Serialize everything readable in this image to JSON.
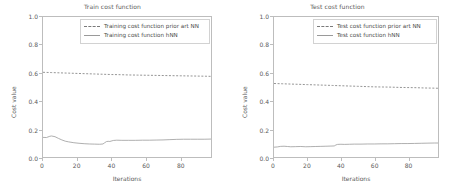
{
  "figure": {
    "background": "#ffffff",
    "axis_color": "#bdbdbd",
    "text_color": "#5a5a5a",
    "dashed_color": "#7a7a7a",
    "solid_color": "#9a9a9a"
  },
  "chart_data": [
    {
      "type": "line",
      "title": "Train cost function",
      "xlabel": "Iterations",
      "ylabel": "Cost value",
      "xlim": [
        0,
        98
      ],
      "ylim": [
        0.0,
        1.0
      ],
      "xticks": [
        0,
        20,
        40,
        60,
        80
      ],
      "yticks": [
        "0.0",
        "0.2",
        "0.4",
        "0.6",
        "0.8",
        "1.0"
      ],
      "grid": false,
      "legend_position": "upper center",
      "series": [
        {
          "name": "Training cost function prior art NN",
          "style": "dashed",
          "color": "#7a7a7a",
          "x": [
            0,
            5,
            10,
            15,
            20,
            25,
            30,
            35,
            40,
            45,
            50,
            55,
            60,
            65,
            70,
            75,
            80,
            85,
            90,
            95,
            98
          ],
          "values": [
            0.605,
            0.603,
            0.601,
            0.599,
            0.597,
            0.595,
            0.593,
            0.591,
            0.589,
            0.588,
            0.586,
            0.585,
            0.584,
            0.583,
            0.582,
            0.581,
            0.58,
            0.579,
            0.578,
            0.577,
            0.576
          ]
        },
        {
          "name": "Training cost function hNN",
          "style": "solid",
          "color": "#9a9a9a",
          "x": [
            0,
            2,
            4,
            5,
            7,
            9,
            11,
            13,
            15,
            18,
            21,
            24,
            27,
            30,
            33,
            35,
            36,
            37,
            38,
            39,
            41,
            43,
            46,
            50,
            54,
            58,
            62,
            66,
            70,
            74,
            78,
            82,
            86,
            90,
            94,
            98
          ],
          "values": [
            0.14,
            0.139,
            0.148,
            0.15,
            0.145,
            0.133,
            0.122,
            0.113,
            0.108,
            0.102,
            0.098,
            0.095,
            0.093,
            0.092,
            0.091,
            0.093,
            0.102,
            0.11,
            0.112,
            0.111,
            0.118,
            0.12,
            0.119,
            0.119,
            0.119,
            0.12,
            0.12,
            0.121,
            0.122,
            0.124,
            0.126,
            0.127,
            0.127,
            0.127,
            0.127,
            0.128
          ]
        }
      ]
    },
    {
      "type": "line",
      "title": "Test cost function",
      "xlabel": "Iterations",
      "ylabel": "Cost value",
      "xlim": [
        0,
        98
      ],
      "ylim": [
        0.0,
        1.0
      ],
      "xticks": [
        0,
        20,
        40,
        60,
        80
      ],
      "yticks": [
        "0.0",
        "0.2",
        "0.4",
        "0.6",
        "0.8",
        "1.0"
      ],
      "grid": false,
      "legend_position": "upper center",
      "series": [
        {
          "name": "Test cost function prior art NN",
          "style": "dashed",
          "color": "#7a7a7a",
          "x": [
            0,
            5,
            10,
            15,
            20,
            25,
            30,
            35,
            40,
            45,
            50,
            55,
            60,
            65,
            70,
            75,
            80,
            85,
            90,
            95,
            98
          ],
          "values": [
            0.525,
            0.523,
            0.521,
            0.519,
            0.517,
            0.515,
            0.513,
            0.511,
            0.509,
            0.507,
            0.505,
            0.503,
            0.501,
            0.5,
            0.499,
            0.497,
            0.496,
            0.495,
            0.493,
            0.492,
            0.491
          ]
        },
        {
          "name": "Test cost function hNN",
          "style": "solid",
          "color": "#9a9a9a",
          "x": [
            0,
            2,
            4,
            6,
            8,
            10,
            13,
            16,
            19,
            22,
            25,
            28,
            31,
            34,
            36,
            37,
            38,
            40,
            42,
            45,
            48,
            52,
            56,
            60,
            64,
            68,
            72,
            76,
            80,
            84,
            88,
            92,
            96,
            98
          ],
          "values": [
            0.07,
            0.072,
            0.076,
            0.077,
            0.075,
            0.073,
            0.074,
            0.075,
            0.073,
            0.074,
            0.075,
            0.076,
            0.077,
            0.078,
            0.079,
            0.086,
            0.09,
            0.091,
            0.09,
            0.091,
            0.092,
            0.092,
            0.093,
            0.093,
            0.094,
            0.094,
            0.095,
            0.096,
            0.096,
            0.097,
            0.098,
            0.099,
            0.1,
            0.1
          ]
        }
      ]
    }
  ]
}
